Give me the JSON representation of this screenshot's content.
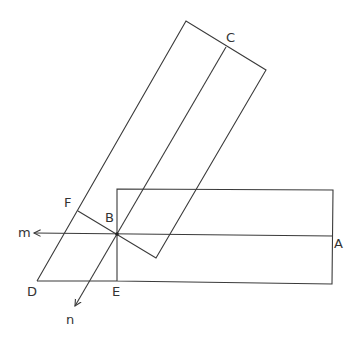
{
  "diagram": {
    "type": "geometry",
    "stroke_color": "#3a3a3a",
    "background": "#ffffff",
    "labels": {
      "A": "A",
      "B": "B",
      "C": "C",
      "D": "D",
      "E": "E",
      "F": "F",
      "m": "m",
      "n": "n"
    },
    "points": {
      "A": [
        333,
        236
      ],
      "B": [
        117,
        234
      ],
      "C": [
        226,
        47
      ],
      "D": [
        37,
        281
      ],
      "E": [
        117,
        281
      ],
      "F": [
        78,
        211
      ]
    }
  }
}
